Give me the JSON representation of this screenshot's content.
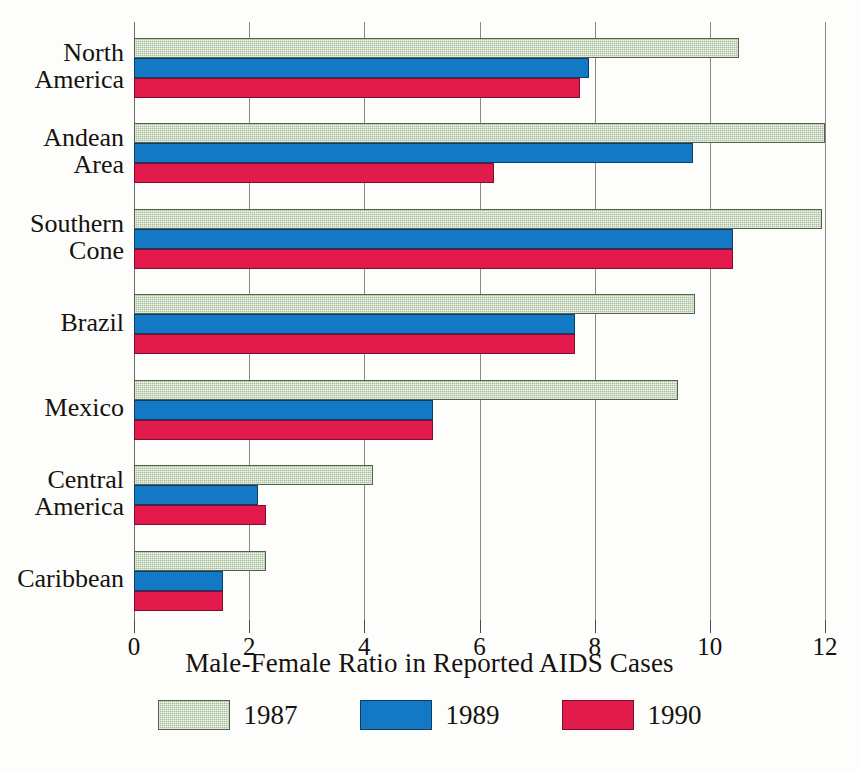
{
  "chart_data": {
    "type": "bar",
    "orientation": "horizontal",
    "title": "",
    "xlabel": "Male-Female Ratio in Reported AIDS Cases",
    "ylabel": "",
    "xlim": [
      0,
      12
    ],
    "xticks": [
      0,
      2,
      4,
      6,
      8,
      10,
      12
    ],
    "grid": true,
    "legend_position": "bottom",
    "categories": [
      "North America",
      "Andean Area",
      "Southern Cone",
      "Brazil",
      "Mexico",
      "Central America",
      "Caribbean"
    ],
    "category_lines": [
      [
        "North",
        "America"
      ],
      [
        "Andean",
        "Area"
      ],
      [
        "Southern",
        "Cone"
      ],
      [
        "Brazil"
      ],
      [
        "Mexico"
      ],
      [
        "Central",
        "America"
      ],
      [
        "Caribbean"
      ]
    ],
    "series": [
      {
        "name": "1987",
        "color": "#a8bf99",
        "values": [
          10.5,
          12.0,
          11.95,
          9.75,
          9.45,
          4.15,
          2.3
        ]
      },
      {
        "name": "1989",
        "color": "#1479c4",
        "values": [
          7.9,
          9.7,
          10.4,
          7.65,
          5.2,
          2.15,
          1.55
        ]
      },
      {
        "name": "1990",
        "color": "#e31b4d",
        "values": [
          7.75,
          6.25,
          10.4,
          7.65,
          5.2,
          2.3,
          1.55
        ]
      }
    ]
  },
  "axis": {
    "title": "Male-Female Ratio in Reported AIDS Cases",
    "tick_labels": [
      "0",
      "2",
      "4",
      "6",
      "8",
      "10",
      "12"
    ]
  },
  "legend": {
    "items": [
      {
        "label": "1987",
        "color": "#a8bf99"
      },
      {
        "label": "1989",
        "color": "#1479c4"
      },
      {
        "label": "1990",
        "color": "#e31b4d"
      }
    ]
  },
  "colors": {
    "series_1987": "#a8bf99",
    "series_1989": "#1479c4",
    "series_1990": "#e31b4d",
    "gridline": "#8a8a86",
    "text": "#15120f",
    "background": "#fdfdfb"
  }
}
